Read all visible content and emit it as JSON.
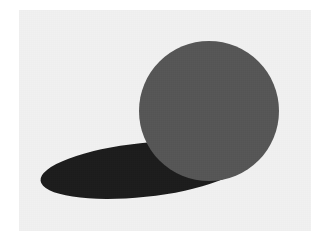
{
  "image": {
    "title": "Gray sphere resting on a plane with a dark elliptical cast shadow",
    "width": 328,
    "height": 245,
    "background_color": "#ffffff",
    "alt_text": "A large medium-gray circle in the upper right of a light gray rectangular field, with a dark near-black elongated ellipse extending down and to the left beneath it, reading as a cast shadow."
  },
  "canvas": {
    "name": "picture-plate",
    "fill_color": "#f1f1f1",
    "x": 19,
    "y": 10,
    "width": 292,
    "height": 221
  },
  "shapes": [
    {
      "name": "cast-shadow",
      "kind": "ellipse",
      "fill_color": "#1c1c1c",
      "center_x": 143,
      "center_y": 170,
      "radius_x": 103,
      "radius_y": 27,
      "rotation_deg": -6
    },
    {
      "name": "sphere",
      "kind": "circle",
      "fill_color": "#565656",
      "center_x": 209,
      "center_y": 111,
      "radius": 70
    }
  ],
  "palette": {
    "paper_white": "#ffffff",
    "field_gray": "#f1f1f1",
    "sphere_gray": "#565656",
    "shadow_black": "#1c1c1c"
  }
}
